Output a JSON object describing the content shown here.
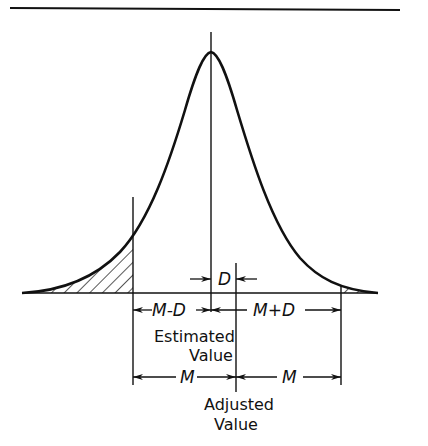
{
  "diagram": {
    "labels": {
      "D": "D",
      "M_minus_D": "M-D",
      "M_plus_D": "M+D",
      "M_left": "M",
      "M_right": "M",
      "estimated_line1": "Estimated",
      "estimated_line2": "Value",
      "adjusted_line1": "Adjusted",
      "adjusted_line2": "Value"
    },
    "colors": {
      "stroke": "#111111",
      "background": "#ffffff"
    }
  }
}
